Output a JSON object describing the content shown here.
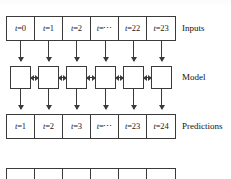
{
  "figure": {
    "kind": "sequence-model-diagram",
    "stroke_color": "#3a3a3a",
    "text_color": "#111111",
    "background": "#ffffff"
  },
  "rows": {
    "inputs": {
      "label": "Inputs",
      "cells": [
        {
          "var": "t",
          "eq": "=0"
        },
        {
          "var": "t",
          "eq": "=1"
        },
        {
          "var": "t",
          "eq": "=2"
        },
        {
          "var": "t",
          "eq": "=⋯"
        },
        {
          "var": "t",
          "eq": "=22"
        },
        {
          "var": "t",
          "eq": "=23"
        }
      ]
    },
    "model": {
      "label": "Model",
      "cells": [
        {
          "content": ""
        },
        {
          "content": ""
        },
        {
          "content": ""
        },
        {
          "content": ""
        },
        {
          "content": ""
        },
        {
          "content": ""
        }
      ]
    },
    "predictions": {
      "label": "Predictions",
      "cells": [
        {
          "var": "t",
          "eq": "=1"
        },
        {
          "var": "t",
          "eq": "=2"
        },
        {
          "var": "t",
          "eq": "=3"
        },
        {
          "var": "t",
          "eq": "=⋯"
        },
        {
          "var": "t",
          "eq": "=23"
        },
        {
          "var": "t",
          "eq": "=24"
        }
      ]
    },
    "cropped": {
      "label": "",
      "cells": [
        {
          "content": ""
        },
        {
          "content": ""
        },
        {
          "content": ""
        },
        {
          "content": ""
        },
        {
          "content": ""
        },
        {
          "content": ""
        }
      ]
    }
  },
  "arrows": {
    "inputs_to_model": "down-arrow",
    "model_to_predictions": "down-arrow",
    "model_recurrent": "bidirectional-arrow",
    "count_per_layer": 6,
    "recurrent_count": 5
  }
}
